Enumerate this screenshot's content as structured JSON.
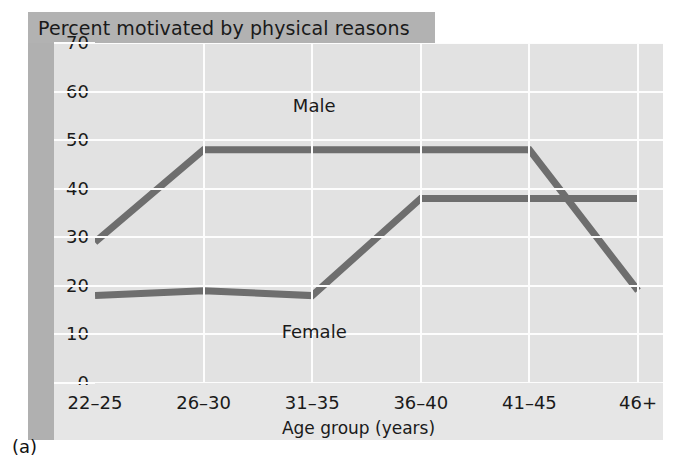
{
  "figure": {
    "title": "Percent motivated by physical reasons",
    "caption": "(a)"
  },
  "chart_data": {
    "type": "line",
    "title": "Percent motivated by physical reasons",
    "xlabel": "Age group (years)",
    "ylabel": "",
    "categories": [
      "22–25",
      "26–30",
      "31–35",
      "36–40",
      "41–45",
      "46+"
    ],
    "series": [
      {
        "name": "Male",
        "values": [
          29,
          48,
          48,
          48,
          48,
          19
        ],
        "color": "#6e6e6e"
      },
      {
        "name": "Female",
        "values": [
          18,
          19,
          18,
          38,
          38,
          38
        ],
        "color": "#6e6e6e"
      }
    ],
    "ylim": [
      0,
      70
    ],
    "ytick_labels": [
      "0",
      "10",
      "20",
      "30",
      "40",
      "50",
      "60",
      "70"
    ],
    "ytick_values": [
      0,
      10,
      20,
      30,
      40,
      50,
      60,
      70
    ],
    "grid": true,
    "legend": "inline-annotations",
    "annotations": [
      {
        "text": "Male",
        "x_category": "31–35",
        "y_value": 57
      },
      {
        "text": "Female",
        "x_category": "31–35",
        "y_value": 10.5
      }
    ]
  },
  "style": {
    "plot_background": "#e2e2e2",
    "panel_background": "#e6e6e6",
    "gridline_color": "#fdfdfd",
    "band_gray": "#b2b2b2",
    "line_color": "#6e6e6e",
    "text_color": "#1a1a1a"
  }
}
